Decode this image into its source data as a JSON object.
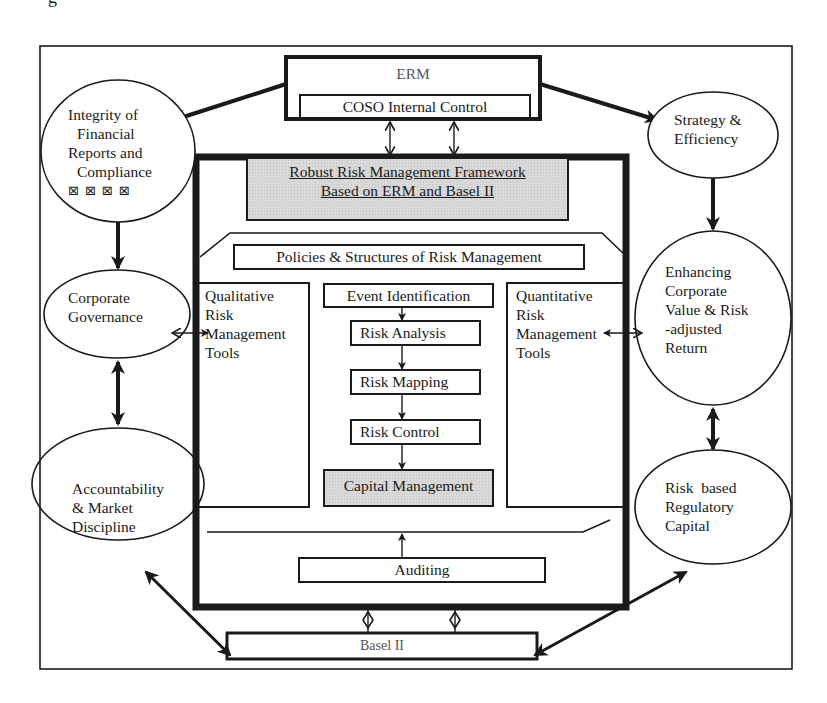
{
  "diagram": {
    "title_fragment": "g",
    "top": {
      "erm_label": "ERM",
      "coso_label": "COSO Internal Control"
    },
    "framework": {
      "title_line1": "Robust Risk Management Framework",
      "title_line2": "Based on ERM and Basel II",
      "policies_label": "Policies & Structures of Risk Management",
      "qualitative": [
        "Qualitative",
        "Risk",
        "Management",
        "Tools"
      ],
      "quantitative": [
        "Quantitative",
        "Risk",
        "Management",
        "Tools"
      ],
      "process_steps": [
        {
          "label": "Event Identification"
        },
        {
          "label": "Risk Analysis"
        },
        {
          "label": "Risk Mapping"
        },
        {
          "label": "Risk Control"
        },
        {
          "label": "Capital Management"
        }
      ],
      "auditing_label": "Auditing"
    },
    "left_ellipses": {
      "integrity": [
        "Integrity of",
        "Financial",
        "Reports and",
        "Compliance"
      ],
      "integrity_glyphs": "⊠⊠⊠⊠",
      "governance": [
        "Corporate",
        "Governance"
      ],
      "accountability": [
        "Accountability",
        "& Market",
        "Discipline"
      ]
    },
    "right_ellipses": {
      "strategy": [
        "Strategy &",
        "Efficiency"
      ],
      "enhancing": [
        "Enhancing",
        "Corporate",
        "Value & Risk",
        "-adjusted",
        "Return"
      ],
      "regulatory": [
        "Risk  based",
        "Regulatory",
        "Capital"
      ]
    },
    "bottom": {
      "basel_label": "Basel II"
    },
    "colors": {
      "line": "#1a1a1a",
      "shade": "#d9d9d9",
      "muted_text": "#555555"
    }
  }
}
